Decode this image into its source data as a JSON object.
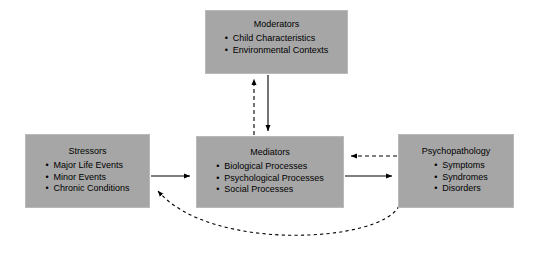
{
  "diagram": {
    "background_color": "#ffffff",
    "node_fill_color": "#a6a6a6",
    "node_border_color": "#b9b9b9",
    "line_color": "#000000",
    "nodes": [
      {
        "id": "moderators",
        "title": "Moderators",
        "items": [
          "Child Characteristics",
          "Environmental Contexts"
        ]
      },
      {
        "id": "stressors",
        "title": "Stressors",
        "items": [
          "Major Life Events",
          "Minor Events",
          "Chronic Conditions"
        ]
      },
      {
        "id": "mediators",
        "title": "Mediators",
        "items": [
          "Biological Processes",
          "Psychological Processes",
          "Social Processes"
        ]
      },
      {
        "id": "psychopathology",
        "title": "Psychopathology",
        "items": [
          "Symptoms",
          "Syndromes",
          "Disorders"
        ]
      }
    ],
    "connectors": [
      {
        "id": "stressors-to-mediators",
        "from": "stressors",
        "to": "mediators",
        "style": "solid",
        "direction": "right"
      },
      {
        "id": "mediators-to-psychopathology",
        "from": "mediators",
        "to": "psychopathology",
        "style": "solid",
        "direction": "right"
      },
      {
        "id": "psychopathology-to-mediators",
        "from": "psychopathology",
        "to": "mediators",
        "style": "dashed",
        "direction": "left"
      },
      {
        "id": "moderators-to-mediators",
        "from": "moderators",
        "to": "mediators",
        "style": "solid",
        "direction": "down"
      },
      {
        "id": "mediators-to-moderators",
        "from": "mediators",
        "to": "moderators",
        "style": "dashed",
        "direction": "up"
      },
      {
        "id": "psychopathology-to-stressors-feedback",
        "from": "psychopathology",
        "to": "stressors",
        "style": "dashed",
        "direction": "curved-left"
      }
    ]
  }
}
